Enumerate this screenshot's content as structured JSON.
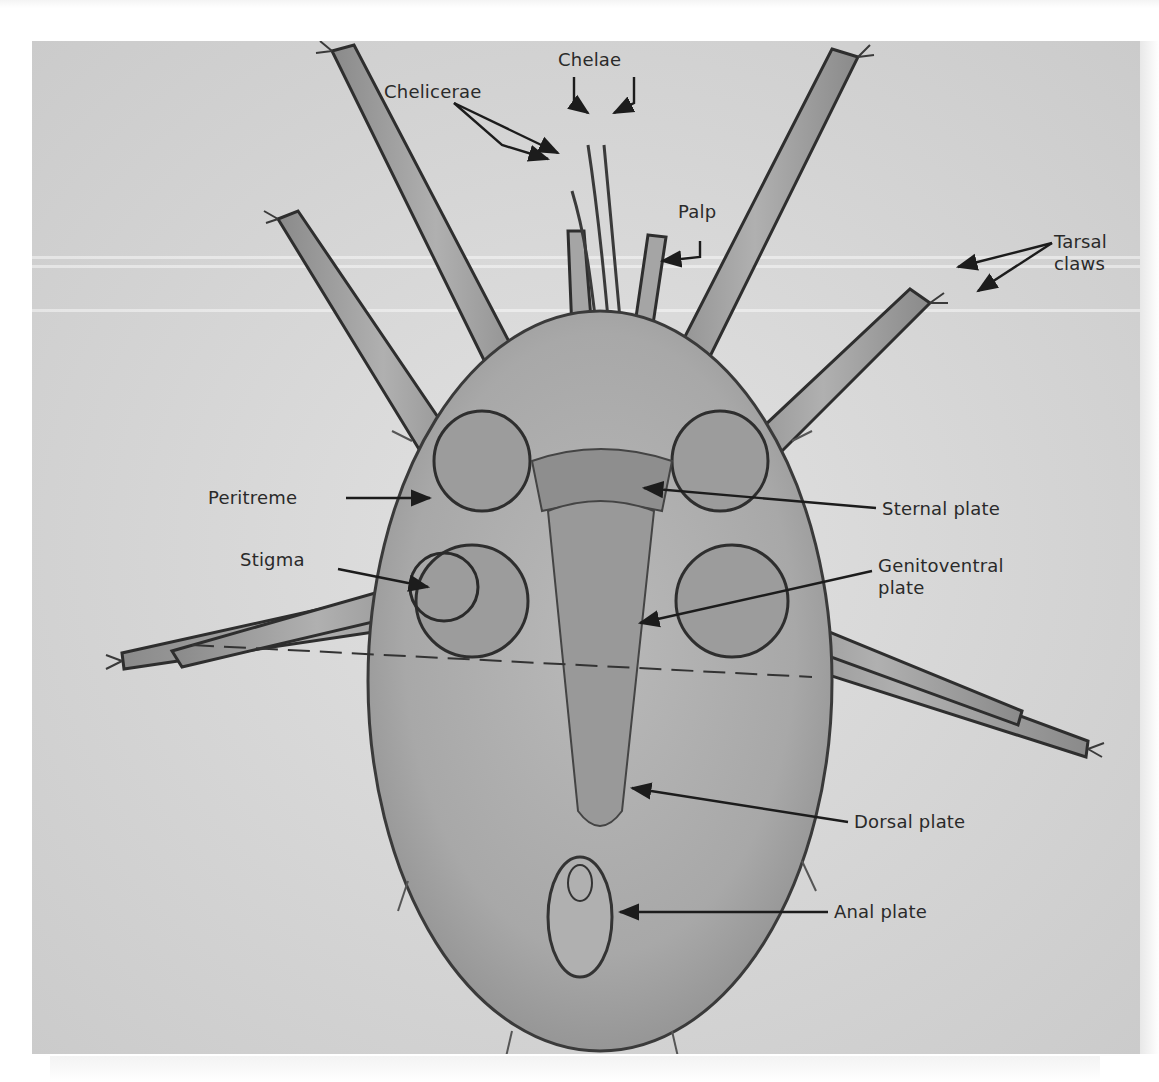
{
  "figure": {
    "background_color": "#d6d6d6",
    "label_color": "#2a2a2a",
    "labels": [
      {
        "id": "chelae",
        "text": "Chelae"
      },
      {
        "id": "chelicerae",
        "text": "Chelicerae"
      },
      {
        "id": "palp",
        "text": "Palp"
      },
      {
        "id": "tarsal-claws-line1",
        "text": "Tarsal"
      },
      {
        "id": "tarsal-claws-line2",
        "text": "claws"
      },
      {
        "id": "peritreme",
        "text": "Peritreme"
      },
      {
        "id": "sternal-plate",
        "text": "Sternal plate"
      },
      {
        "id": "stigma",
        "text": "Stigma"
      },
      {
        "id": "genitoventral-line1",
        "text": "Genitoventral"
      },
      {
        "id": "genitoventral-line2",
        "text": "plate"
      },
      {
        "id": "dorsal-plate",
        "text": "Dorsal plate"
      },
      {
        "id": "anal-plate",
        "text": "Anal plate"
      }
    ]
  }
}
